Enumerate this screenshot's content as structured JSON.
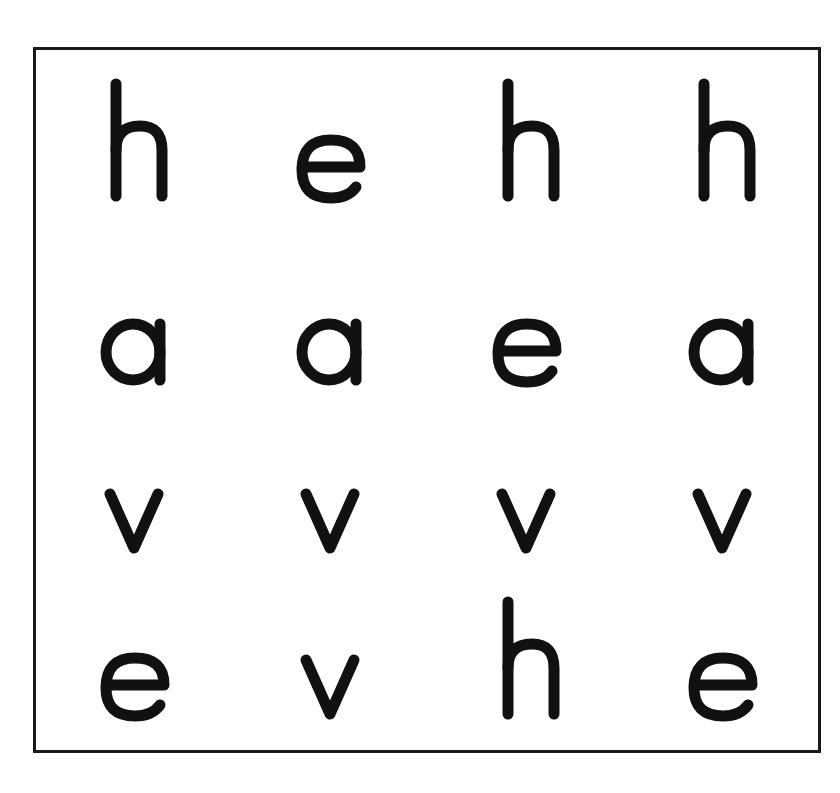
{
  "grid": {
    "rows": 4,
    "cols": 4,
    "cells": [
      [
        "h",
        "e",
        "h",
        "h"
      ],
      [
        "a",
        "a",
        "e",
        "a"
      ],
      [
        "v",
        "v",
        "v",
        "v"
      ],
      [
        "e",
        "v",
        "h",
        "e"
      ]
    ]
  },
  "colors": {
    "ink": "#111111",
    "background": "#ffffff",
    "border": "#1a1a1a"
  }
}
